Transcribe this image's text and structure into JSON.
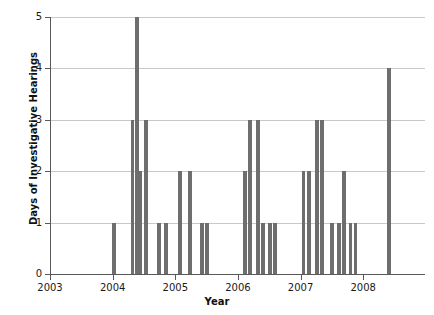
{
  "chart_data": {
    "type": "bar",
    "title": "",
    "xlabel": "Year",
    "ylabel": "Days of Investigative Hearings",
    "xlim": [
      2003.0,
      2008.97
    ],
    "ylim": [
      0,
      5
    ],
    "grid": true,
    "legend": null,
    "bar_color": "#6e6e6e",
    "axis_color": "#595959",
    "grid_color": "#c9c9c9",
    "background": "#ffffff",
    "y_ticks": [
      0,
      1,
      2,
      3,
      4,
      5
    ],
    "y_tick_labels": [
      "0",
      "1",
      "2",
      "3",
      "4",
      "5"
    ],
    "x_ticks": [
      2003,
      2004,
      2005,
      2006,
      2007,
      2008
    ],
    "x_tick_labels": [
      "2003",
      "2004",
      "2005",
      "2006",
      "2007",
      "2008"
    ],
    "x": [
      2004.0,
      2004.3,
      2004.37,
      2004.43,
      2004.52,
      2004.72,
      2004.84,
      2005.06,
      2005.22,
      2005.41,
      2005.49,
      2006.1,
      2006.18,
      2006.3,
      2006.38,
      2006.5,
      2006.58,
      2007.03,
      2007.12,
      2007.25,
      2007.33,
      2007.49,
      2007.6,
      2007.68,
      2007.78,
      2007.86,
      2008.4
    ],
    "values": [
      1,
      3,
      5,
      2,
      3,
      1,
      1,
      2,
      2,
      1,
      1,
      2,
      3,
      3,
      1,
      1,
      1,
      2,
      2,
      3,
      3,
      1,
      1,
      2,
      1,
      1,
      4
    ],
    "bar_width_years": 0.06,
    "n_bars": 27,
    "max_value": 5
  }
}
